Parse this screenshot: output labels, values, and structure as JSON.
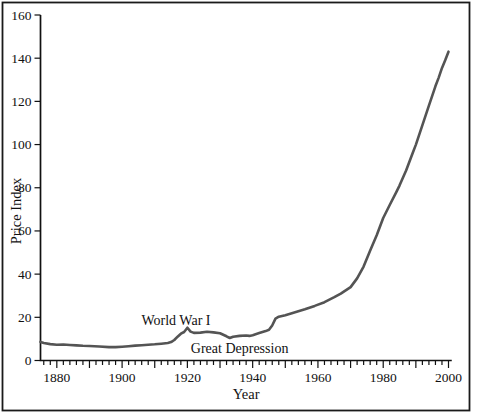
{
  "figure": {
    "background": "#ffffff",
    "border_color": "#1a1a1a"
  },
  "chart_data": {
    "type": "line",
    "title": "",
    "xlabel": "Year",
    "ylabel": "Price Index",
    "x_range": [
      1875,
      2000
    ],
    "x_axis_overhang_years": 1,
    "ylim": [
      0,
      160
    ],
    "grid": false,
    "legend": false,
    "axis_color": "#111111",
    "line_color": "#545454",
    "y_ticks": [
      0,
      20,
      40,
      60,
      80,
      100,
      120,
      140,
      160
    ],
    "x_major_ticks": [
      1880,
      1900,
      1920,
      1940,
      1960,
      1980,
      2000
    ],
    "x_decade_tick_interval": 10,
    "x_minor_tick_interval": 2,
    "annotations": [
      {
        "text": "World War I",
        "year": 1916.5,
        "value": 18.4
      },
      {
        "text": "Great Depression",
        "year": 1936,
        "value": 5.5
      }
    ],
    "series": [
      {
        "name": "Price Index",
        "points": [
          [
            1875,
            8.6
          ],
          [
            1876,
            8.1
          ],
          [
            1878,
            7.6
          ],
          [
            1880,
            7.3
          ],
          [
            1882,
            7.4
          ],
          [
            1884,
            7.2
          ],
          [
            1886,
            7.0
          ],
          [
            1888,
            6.8
          ],
          [
            1890,
            6.7
          ],
          [
            1893,
            6.5
          ],
          [
            1896,
            6.2
          ],
          [
            1898,
            6.2
          ],
          [
            1900,
            6.4
          ],
          [
            1902,
            6.6
          ],
          [
            1904,
            6.9
          ],
          [
            1906,
            7.1
          ],
          [
            1908,
            7.3
          ],
          [
            1910,
            7.5
          ],
          [
            1912,
            7.8
          ],
          [
            1914,
            8.1
          ],
          [
            1915,
            8.5
          ],
          [
            1916,
            9.5
          ],
          [
            1917,
            11.0
          ],
          [
            1918,
            12.4
          ],
          [
            1919,
            13.2
          ],
          [
            1920,
            15.2
          ],
          [
            1921,
            13.4
          ],
          [
            1922,
            12.8
          ],
          [
            1924,
            12.9
          ],
          [
            1926,
            13.3
          ],
          [
            1928,
            13.0
          ],
          [
            1930,
            12.6
          ],
          [
            1932,
            11.2
          ],
          [
            1933,
            10.4
          ],
          [
            1934,
            11.0
          ],
          [
            1936,
            11.4
          ],
          [
            1938,
            11.6
          ],
          [
            1939,
            11.4
          ],
          [
            1940,
            11.7
          ],
          [
            1942,
            12.7
          ],
          [
            1944,
            13.6
          ],
          [
            1945,
            14.2
          ],
          [
            1946,
            16.2
          ],
          [
            1947,
            19.4
          ],
          [
            1948,
            20.3
          ],
          [
            1950,
            21.0
          ],
          [
            1953,
            22.3
          ],
          [
            1956,
            23.7
          ],
          [
            1959,
            25.3
          ],
          [
            1962,
            27.0
          ],
          [
            1965,
            29.3
          ],
          [
            1967,
            31.0
          ],
          [
            1970,
            34.0
          ],
          [
            1972,
            38.0
          ],
          [
            1974,
            43.5
          ],
          [
            1976,
            51.0
          ],
          [
            1978,
            58.0
          ],
          [
            1980,
            66.0
          ],
          [
            1982,
            72.0
          ],
          [
            1984,
            78.0
          ],
          [
            1985,
            81.0
          ],
          [
            1987,
            88.0
          ],
          [
            1989,
            96.0
          ],
          [
            1990,
            100.0
          ],
          [
            1992,
            109.0
          ],
          [
            1994,
            118.0
          ],
          [
            1996,
            127.0
          ],
          [
            1997,
            131.0
          ],
          [
            1998,
            135.5
          ],
          [
            1999,
            139.0
          ],
          [
            2000,
            143.0
          ]
        ]
      }
    ]
  }
}
